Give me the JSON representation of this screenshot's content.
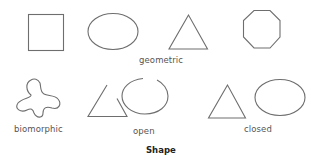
{
  "figure": {
    "title": "Shape",
    "stroke_color": "#6e6e6e",
    "groups": [
      {
        "label": "geometric",
        "shapes": [
          "square",
          "ellipse",
          "triangle",
          "octagon"
        ]
      },
      {
        "label": "biomorphic",
        "shapes": [
          "blob"
        ]
      },
      {
        "label": "open",
        "shapes": [
          "open-triangle",
          "open-ellipse"
        ]
      },
      {
        "label": "closed",
        "shapes": [
          "closed-triangle",
          "closed-ellipse"
        ]
      }
    ]
  }
}
